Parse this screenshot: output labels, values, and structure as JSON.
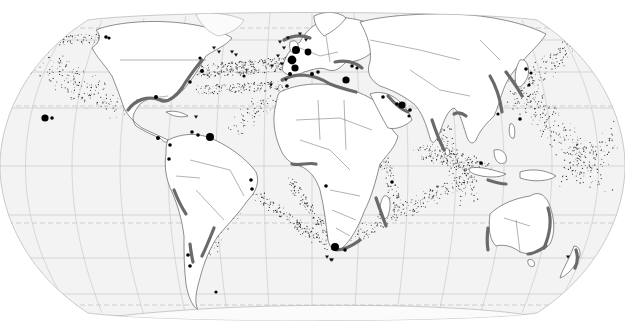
{
  "map": {
    "projection": "pseudocylindrical world (Eckert-like)",
    "style": "grayscale",
    "colors": {
      "ocean": "#f3f3f3",
      "land": "#ffffff",
      "coast_band": "#6a6a6a",
      "shipping_dots": "#333333",
      "markers": "#000000",
      "graticule": "#c4c4c4"
    },
    "layers": [
      {
        "id": "graticule",
        "description": "meridians and parallels, tropics/polar circles dashed"
      },
      {
        "id": "land",
        "description": "continents with country borders"
      },
      {
        "id": "coastal-zones",
        "description": "dark gray bands along coastlines"
      },
      {
        "id": "shipping-lanes",
        "description": "stippled dot density along sea routes"
      },
      {
        "id": "point-markers",
        "description": "black circles of varying size"
      },
      {
        "id": "triangle-markers",
        "description": "small downward triangles"
      }
    ],
    "coastal_zones": [
      {
        "region": "US Gulf Coast",
        "path": "M128 110 C135 100 148 95 160 100 C168 104 176 96 182 88"
      },
      {
        "region": "US East Coast",
        "path": "M182 88 C188 78 194 70 202 60"
      },
      {
        "region": "North Sea / W Europe",
        "path": "M284 40 C292 36 300 34 310 38"
      },
      {
        "region": "Mediterranean",
        "path": "M282 80 C296 72 314 74 330 84 C340 88 348 90 356 92"
      },
      {
        "region": "Black Sea / Turkey",
        "path": "M335 62 C345 60 355 62 362 68"
      },
      {
        "region": "Persian Gulf",
        "path": "M388 96 C395 104 402 110 408 112"
      },
      {
        "region": "India West Coast",
        "path": "M432 120 C436 132 440 142 444 150"
      },
      {
        "region": "Bay of Bengal",
        "path": "M454 114 C458 112 462 113 466 116"
      },
      {
        "region": "China Coast",
        "path": "M490 76 C496 86 500 98 502 112"
      },
      {
        "region": "Korea / Japan",
        "path": "M506 72 C512 80 518 88 522 96"
      },
      {
        "region": "Gulf of Guinea",
        "path": "M292 164 C300 166 308 162 316 164"
      },
      {
        "region": "Mozambique Channel",
        "path": "M376 198 C380 210 384 220 386 226"
      },
      {
        "region": "South Africa",
        "path": "M336 250 C344 250 352 246 360 240"
      },
      {
        "region": "Peru / Chile",
        "path": "M174 190 C178 200 182 208 186 214"
      },
      {
        "region": "Central Chile",
        "path": "M190 244 C191 252 192 258 193 262"
      },
      {
        "region": "Brazil SE",
        "path": "M214 228 C210 238 206 248 202 256"
      },
      {
        "region": "W Australia",
        "path": "M488 228 C487 236 487 244 488 250"
      },
      {
        "region": "E Australia",
        "path": "M548 208 C552 220 550 234 544 248"
      },
      {
        "region": "SE Australia",
        "path": "M528 254 C534 254 540 250 546 246"
      },
      {
        "region": "New Zealand",
        "path": "M576 250 C578 256 578 262 575 268"
      },
      {
        "region": "Indonesia",
        "path": "M488 180 C494 182 500 184 506 184"
      }
    ],
    "point_markers": [
      {
        "label": "Hawaii",
        "x": 45,
        "y": 118,
        "r": 3.6
      },
      {
        "label": "Hawaii-2",
        "x": 52,
        "y": 118,
        "r": 1.8
      },
      {
        "label": "Alaska",
        "x": 106,
        "y": 37,
        "r": 1.8
      },
      {
        "label": "Alaska-2",
        "x": 109,
        "y": 38,
        "r": 1.6
      },
      {
        "label": "Great Lakes",
        "x": 200,
        "y": 58,
        "r": 1.6
      },
      {
        "label": "New York",
        "x": 202,
        "y": 71,
        "r": 2.0
      },
      {
        "label": "Gulf",
        "x": 156,
        "y": 97,
        "r": 2.0
      },
      {
        "label": "Virginia",
        "x": 190,
        "y": 82,
        "r": 1.8
      },
      {
        "label": "Caribbean",
        "x": 210,
        "y": 137,
        "r": 4.0
      },
      {
        "label": "Venezuela",
        "x": 192,
        "y": 132,
        "r": 1.8
      },
      {
        "label": "Venezuela-2",
        "x": 198,
        "y": 135,
        "r": 1.8
      },
      {
        "label": "Panama",
        "x": 158,
        "y": 138,
        "r": 2.0
      },
      {
        "label": "Colombia",
        "x": 170,
        "y": 145,
        "r": 1.8
      },
      {
        "label": "Ecuador",
        "x": 169,
        "y": 159,
        "r": 1.8
      },
      {
        "label": "Brazil NE",
        "x": 251,
        "y": 180,
        "r": 1.8
      },
      {
        "label": "Brazil NE-2",
        "x": 252,
        "y": 189,
        "r": 1.8
      },
      {
        "label": "Chile N",
        "x": 188,
        "y": 255,
        "r": 1.8
      },
      {
        "label": "Chile S",
        "x": 190,
        "y": 266,
        "r": 1.8
      },
      {
        "label": "Argentina S",
        "x": 216,
        "y": 292,
        "r": 1.6
      },
      {
        "label": "Rotterdam",
        "x": 296,
        "y": 50,
        "r": 4.0
      },
      {
        "label": "London",
        "x": 292,
        "y": 60,
        "r": 4.4
      },
      {
        "label": "Antwerp",
        "x": 308,
        "y": 52,
        "r": 3.4
      },
      {
        "label": "Le Havre",
        "x": 295,
        "y": 68,
        "r": 3.6
      },
      {
        "label": "Bay of Biscay",
        "x": 290,
        "y": 74,
        "r": 2.0
      },
      {
        "label": "Lisbon",
        "x": 287,
        "y": 86,
        "r": 1.8
      },
      {
        "label": "Mid-Atlantic",
        "x": 244,
        "y": 76,
        "r": 1.6
      },
      {
        "label": "Barcelona",
        "x": 312,
        "y": 74,
        "r": 2.0
      },
      {
        "label": "Genoa",
        "x": 318,
        "y": 72,
        "r": 1.8
      },
      {
        "label": "Adriatic",
        "x": 352,
        "y": 66,
        "r": 1.8
      },
      {
        "label": "Eastern Med",
        "x": 346,
        "y": 80,
        "r": 3.6
      },
      {
        "label": "Istanbul",
        "x": 357,
        "y": 68,
        "r": 1.6
      },
      {
        "label": "Red Sea",
        "x": 383,
        "y": 97,
        "r": 1.8
      },
      {
        "label": "Persian Gulf",
        "x": 402,
        "y": 105,
        "r": 3.6
      },
      {
        "label": "Gulf-2",
        "x": 397,
        "y": 104,
        "r": 1.8
      },
      {
        "label": "Oman",
        "x": 410,
        "y": 110,
        "r": 1.8
      },
      {
        "label": "Oman-2",
        "x": 409,
        "y": 116,
        "r": 1.6
      },
      {
        "label": "West Africa",
        "x": 326,
        "y": 186,
        "r": 1.8
      },
      {
        "label": "Cape Town",
        "x": 335,
        "y": 247,
        "r": 4.0
      },
      {
        "label": "Port Elizabeth",
        "x": 345,
        "y": 250,
        "r": 1.8
      },
      {
        "label": "Madagascar N",
        "x": 392,
        "y": 182,
        "r": 1.8
      },
      {
        "label": "Japan N",
        "x": 526,
        "y": 69,
        "r": 1.8
      },
      {
        "label": "Japan",
        "x": 531,
        "y": 73,
        "r": 1.6
      },
      {
        "label": "Japan S",
        "x": 529,
        "y": 85,
        "r": 1.6
      },
      {
        "label": "Taiwan",
        "x": 498,
        "y": 114,
        "r": 1.6
      },
      {
        "label": "Philippines",
        "x": 520,
        "y": 119,
        "r": 1.8
      },
      {
        "label": "Singapore",
        "x": 481,
        "y": 163,
        "r": 1.8
      }
    ],
    "triangle_markers": [
      {
        "x": 232,
        "y": 52
      },
      {
        "x": 236,
        "y": 55
      },
      {
        "x": 280,
        "y": 42
      },
      {
        "x": 284,
        "y": 48
      },
      {
        "x": 288,
        "y": 38
      },
      {
        "x": 278,
        "y": 56
      },
      {
        "x": 282,
        "y": 64
      },
      {
        "x": 272,
        "y": 66
      },
      {
        "x": 286,
        "y": 80
      },
      {
        "x": 271,
        "y": 85
      },
      {
        "x": 300,
        "y": 34
      },
      {
        "x": 306,
        "y": 40
      },
      {
        "x": 327,
        "y": 257
      },
      {
        "x": 332,
        "y": 260
      },
      {
        "x": 331,
        "y": 260
      },
      {
        "x": 196,
        "y": 117
      },
      {
        "x": 568,
        "y": 257
      },
      {
        "x": 214,
        "y": 48
      },
      {
        "x": 219,
        "y": 52
      }
    ]
  }
}
